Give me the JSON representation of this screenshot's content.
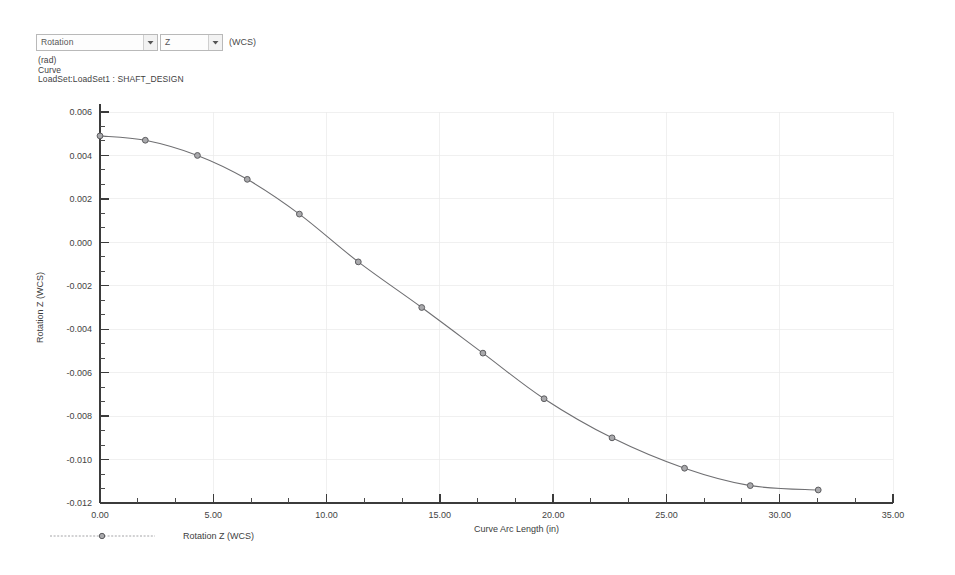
{
  "toolbar": {
    "quantity_select": {
      "name": "quantity-select",
      "value": "Rotation",
      "options": [
        "Displacement",
        "Rotation",
        "Stress",
        "Strain"
      ]
    },
    "component_select": {
      "name": "component-select",
      "value": "Z",
      "options": [
        "X",
        "Y",
        "Z",
        "Magnitude"
      ]
    },
    "coordinate_system_suffix": "(WCS)",
    "dropdown_arrow_icon": "chevron-down-icon"
  },
  "caption": {
    "units": "(rad)",
    "entity": "Curve",
    "loadset": "LoadSet:LoadSet1 : SHAFT_DESIGN"
  },
  "legend": {
    "label": "Rotation Z (WCS)",
    "marker_icon": "circle-marker-icon",
    "line_color": "#9a9a9d"
  },
  "chart_data": {
    "type": "line",
    "title": "",
    "subtitle": "",
    "xlabel": "Curve Arc Length (in)",
    "ylabel": "Rotation Z (WCS)",
    "xlim": [
      0.0,
      35.0
    ],
    "ylim": [
      -0.012,
      0.006
    ],
    "xticks": [
      0.0,
      5.0,
      10.0,
      15.0,
      20.0,
      25.0,
      30.0,
      35.0
    ],
    "xtick_labels": [
      "0.00",
      "5.00",
      "10.00",
      "15.00",
      "20.00",
      "25.00",
      "30.00",
      "35.00"
    ],
    "yticks": [
      0.006,
      0.004,
      0.002,
      0.0,
      -0.002,
      -0.004,
      -0.006,
      -0.008,
      -0.01,
      -0.012
    ],
    "ytick_labels": [
      "0.006",
      "0.004",
      "0.002",
      "0.000",
      "-0.002",
      "-0.004",
      "-0.006",
      "-0.008",
      "-0.010",
      "-0.012"
    ],
    "x_minor_ticks_per_interval": 2,
    "y_minor_ticks_per_interval": 2,
    "grid": true,
    "grid_color": "#e9e9e9",
    "legend_position": "below-left",
    "series": [
      {
        "name": "Rotation Z (WCS)",
        "line_color": "#6f6f72",
        "marker": "circle",
        "marker_fill": "#a9a9ac",
        "x": [
          0.0,
          2.0,
          4.3,
          6.5,
          8.8,
          11.4,
          14.2,
          16.9,
          19.6,
          22.6,
          25.8,
          28.7,
          31.7
        ],
        "y": [
          0.0049,
          0.0047,
          0.004,
          0.0029,
          0.0013,
          -0.0009,
          -0.003,
          -0.0051,
          -0.0072,
          -0.009,
          -0.0104,
          -0.0112,
          -0.0114
        ]
      }
    ]
  }
}
